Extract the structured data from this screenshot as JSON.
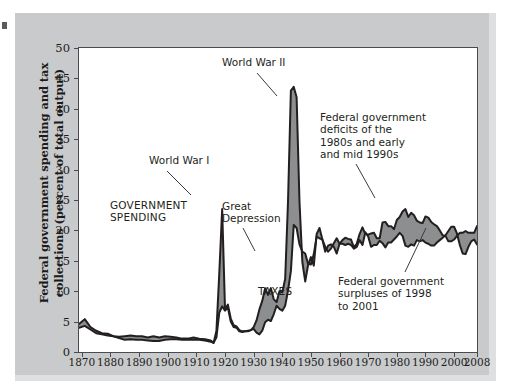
{
  "figure": {
    "y_axis_title": "Federal government spending and tax collections\n(percent of total output)",
    "x_axis_title": "Year"
  },
  "annotations": [
    {
      "id": "world-war-1",
      "text": "World War I"
    },
    {
      "id": "world-war-2",
      "text": "World War II"
    },
    {
      "id": "government-spending",
      "text": "GOVERNMENT\nSPENDING"
    },
    {
      "id": "great-depression",
      "text": "Great\nDepression"
    },
    {
      "id": "taxes",
      "text": "TAXES"
    },
    {
      "id": "deficits",
      "text": "Federal government\ndeficits of the\n1980s and early\nand mid 1990s"
    },
    {
      "id": "surpluses",
      "text": "Federal government\nsurpluses of 1998\nto 2001"
    }
  ],
  "colors": {
    "panel_background": "#c9cacb",
    "plot_background": "#ffffff",
    "axis_line": "#4a4b4d",
    "series_line": "#231f20",
    "gap_fill": "#8d8e90",
    "text": "#231f20"
  },
  "chart_data": {
    "type": "area",
    "title": "",
    "xlabel": "Year",
    "ylabel": "Federal government spending and tax collections (percent of total output)",
    "xlim": [
      1869,
      2008
    ],
    "ylim": [
      0,
      50
    ],
    "ytick_labels": [
      "0",
      "5",
      "10",
      "15",
      "20",
      "25",
      "30",
      "35",
      "40",
      "45",
      "50"
    ],
    "ytick_values": [
      0,
      5,
      10,
      15,
      20,
      25,
      30,
      35,
      40,
      45,
      50
    ],
    "xtick_labels": [
      "1870",
      "1880",
      "1890",
      "1900",
      "1910",
      "1920",
      "1930",
      "1940",
      "1950",
      "1960",
      "1970",
      "1980",
      "1990",
      "2000",
      "2008"
    ],
    "xtick_values": [
      1870,
      1880,
      1890,
      1900,
      1910,
      1920,
      1930,
      1940,
      1950,
      1960,
      1970,
      1980,
      1990,
      2000,
      2008
    ],
    "grid": false,
    "legend": "none",
    "series": [
      {
        "name": "GOVERNMENT SPENDING",
        "x": [
          1869,
          1871,
          1873,
          1875,
          1877,
          1879,
          1881,
          1883,
          1885,
          1887,
          1889,
          1891,
          1893,
          1895,
          1897,
          1899,
          1901,
          1903,
          1905,
          1907,
          1909,
          1911,
          1913,
          1915,
          1916,
          1917,
          1918,
          1919,
          1920,
          1921,
          1922,
          1923,
          1924,
          1925,
          1926,
          1927,
          1928,
          1929,
          1930,
          1931,
          1932,
          1933,
          1934,
          1935,
          1936,
          1937,
          1938,
          1939,
          1940,
          1941,
          1942,
          1943,
          1944,
          1945,
          1946,
          1947,
          1948,
          1949,
          1950,
          1951,
          1952,
          1953,
          1954,
          1955,
          1956,
          1957,
          1958,
          1959,
          1960,
          1961,
          1962,
          1963,
          1964,
          1965,
          1966,
          1967,
          1968,
          1969,
          1970,
          1971,
          1972,
          1973,
          1974,
          1975,
          1976,
          1977,
          1978,
          1979,
          1980,
          1981,
          1982,
          1983,
          1984,
          1985,
          1986,
          1987,
          1988,
          1989,
          1990,
          1991,
          1992,
          1993,
          1994,
          1995,
          1996,
          1997,
          1998,
          1999,
          2000,
          2001,
          2002,
          2003,
          2004,
          2005,
          2006,
          2007,
          2008
        ],
        "values": [
          4.6,
          5.4,
          4.1,
          3.5,
          3.1,
          3.0,
          2.6,
          2.5,
          2.6,
          2.7,
          2.6,
          2.6,
          2.4,
          2.6,
          2.4,
          2.6,
          2.5,
          2.4,
          2.2,
          2.2,
          2.4,
          2.2,
          2.1,
          1.9,
          1.5,
          3.5,
          13.0,
          23.5,
          7.0,
          7.8,
          5.5,
          4.4,
          4.2,
          3.6,
          3.4,
          3.4,
          3.5,
          3.6,
          4.1,
          5.2,
          7.0,
          8.4,
          10.5,
          9.4,
          10.5,
          8.7,
          8.2,
          10.0,
          9.8,
          12.0,
          24.8,
          43.0,
          43.6,
          41.9,
          24.8,
          14.8,
          11.6,
          14.3,
          15.6,
          14.2,
          19.4,
          20.4,
          18.5,
          17.3,
          16.5,
          17.0,
          17.9,
          18.7,
          17.8,
          18.4,
          18.8,
          18.6,
          18.5,
          17.2,
          17.8,
          19.4,
          20.5,
          19.4,
          19.3,
          19.5,
          19.6,
          18.7,
          18.7,
          21.3,
          21.4,
          20.7,
          20.7,
          20.2,
          21.7,
          22.2,
          23.1,
          23.5,
          22.2,
          22.9,
          22.5,
          21.6,
          21.3,
          21.2,
          22.3,
          22.1,
          21.4,
          21.0,
          20.7,
          20.0,
          19.2,
          19.1,
          18.2,
          18.2,
          18.5,
          19.1,
          19.6,
          19.6,
          19.9,
          19.6,
          19.6,
          19.6,
          20.7
        ]
      },
      {
        "name": "TAXES",
        "x": [
          1869,
          1871,
          1873,
          1875,
          1877,
          1879,
          1881,
          1883,
          1885,
          1887,
          1889,
          1891,
          1893,
          1895,
          1897,
          1899,
          1901,
          1903,
          1905,
          1907,
          1909,
          1911,
          1913,
          1915,
          1916,
          1917,
          1918,
          1919,
          1920,
          1921,
          1922,
          1923,
          1924,
          1925,
          1926,
          1927,
          1928,
          1929,
          1930,
          1931,
          1932,
          1933,
          1934,
          1935,
          1936,
          1937,
          1938,
          1939,
          1940,
          1941,
          1942,
          1943,
          1944,
          1945,
          1946,
          1947,
          1948,
          1949,
          1950,
          1951,
          1952,
          1953,
          1954,
          1955,
          1956,
          1957,
          1958,
          1959,
          1960,
          1961,
          1962,
          1963,
          1964,
          1965,
          1966,
          1967,
          1968,
          1969,
          1970,
          1971,
          1972,
          1973,
          1974,
          1975,
          1976,
          1977,
          1978,
          1979,
          1980,
          1981,
          1982,
          1983,
          1984,
          1985,
          1986,
          1987,
          1988,
          1989,
          1990,
          1991,
          1992,
          1993,
          1994,
          1995,
          1996,
          1997,
          1998,
          1999,
          2000,
          2001,
          2002,
          2003,
          2004,
          2005,
          2006,
          2007,
          2008
        ],
        "values": [
          4.0,
          4.3,
          3.7,
          3.1,
          2.9,
          2.7,
          2.6,
          2.3,
          2.0,
          2.1,
          2.0,
          2.0,
          1.9,
          1.8,
          1.8,
          2.0,
          2.1,
          2.1,
          2.0,
          2.0,
          2.0,
          2.0,
          1.9,
          1.7,
          1.5,
          2.4,
          6.5,
          7.5,
          6.8,
          7.3,
          5.0,
          4.1,
          4.0,
          3.4,
          3.3,
          3.4,
          3.4,
          3.6,
          3.8,
          3.2,
          2.9,
          3.5,
          4.9,
          5.3,
          5.1,
          6.2,
          7.6,
          7.1,
          6.8,
          7.6,
          10.1,
          13.3,
          20.9,
          20.4,
          17.7,
          16.5,
          16.2,
          14.5,
          14.4,
          16.1,
          19.0,
          18.7,
          18.5,
          16.5,
          17.5,
          17.7,
          17.3,
          16.2,
          17.8,
          17.8,
          17.6,
          17.8,
          17.6,
          17.0,
          17.3,
          18.4,
          17.6,
          19.7,
          19.0,
          17.3,
          17.6,
          17.6,
          18.3,
          17.9,
          17.2,
          18.0,
          18.0,
          18.5,
          19.0,
          19.6,
          19.1,
          17.5,
          17.3,
          17.7,
          17.5,
          18.4,
          18.2,
          18.4,
          18.0,
          17.8,
          17.5,
          17.5,
          18.0,
          18.4,
          18.8,
          19.2,
          19.9,
          20.6,
          20.6,
          19.5,
          17.6,
          16.2,
          16.1,
          17.3,
          18.2,
          18.5,
          17.7
        ]
      }
    ]
  }
}
